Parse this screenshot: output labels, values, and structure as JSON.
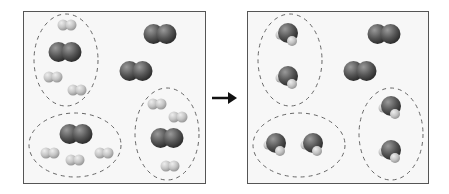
{
  "diagram": {
    "colors": {
      "box_border": "#555555",
      "box_fill": "#f7f7f7",
      "oxygen": "#555555",
      "hydrogen": "#c8c8c8",
      "dash": "#666666",
      "arrow": "#111111"
    },
    "reactants_box": {
      "label": "before",
      "groups": [
        {
          "o2": 1,
          "h2": 3
        },
        {
          "o2": 1,
          "h2": 4
        },
        {
          "o2": 1,
          "h2": 3
        }
      ],
      "free_o2": 2
    },
    "products_box": {
      "label": "after",
      "groups": [
        {
          "h2o": 2
        },
        {
          "h2o": 2
        },
        {
          "h2o": 2
        }
      ],
      "free_o2": 2
    },
    "arrow": "right-arrow"
  }
}
